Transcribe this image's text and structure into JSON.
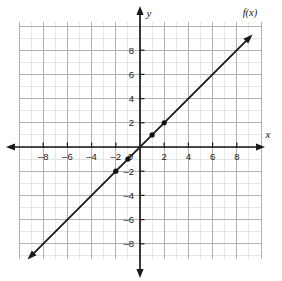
{
  "chart_data": {
    "type": "line",
    "title": "",
    "subtitle": "",
    "xlabel": "x",
    "ylabel": "y",
    "function_label": "f(x)",
    "equation": "f(x) = x",
    "slope": 1,
    "intercept": 0,
    "xlim": [
      -9.5,
      9.5
    ],
    "ylim": [
      -9.5,
      9.5
    ],
    "grid": true,
    "grid_minor_step": 1,
    "grid_major_step": 2,
    "legend": "none",
    "axis_arrows": true,
    "line_arrows_both_ends": true,
    "x_ticks": [
      -8,
      -6,
      -4,
      -2,
      0,
      2,
      4,
      6,
      8
    ],
    "x_tick_labels": [
      "–8",
      "–6",
      "–4",
      "–2",
      "0",
      "2",
      "4",
      "6",
      "8"
    ],
    "y_ticks": [
      -8,
      -6,
      -4,
      -2,
      2,
      4,
      6,
      8
    ],
    "y_tick_labels": [
      "–8",
      "–6",
      "–4",
      "–2",
      "2",
      "4",
      "6",
      "8"
    ],
    "series": [
      {
        "name": "f(x)",
        "x": [
          -9.3,
          9.3
        ],
        "y": [
          -9.3,
          9.3
        ],
        "color": "#1a1a1a"
      }
    ],
    "points": [
      {
        "x": -2,
        "y": -2
      },
      {
        "x": -1,
        "y": -1
      },
      {
        "x": 1,
        "y": 1
      },
      {
        "x": 2,
        "y": 2
      }
    ]
  },
  "colors": {
    "background": "#ffffff",
    "grid_minor": "#d8d8d8",
    "grid_major": "#a8a8a8",
    "axis": "#1a1a1a",
    "line": "#1a1a1a",
    "point": "#111111",
    "text": "#1a1a1a"
  }
}
